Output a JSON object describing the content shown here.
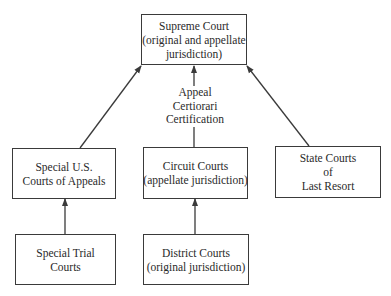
{
  "diagram": {
    "nodes": {
      "supreme": {
        "lines": [
          "Supreme Court",
          "(original and appellate",
          "jurisdiction)"
        ]
      },
      "special_appeals": {
        "lines": [
          "Special U.S.",
          "Courts of Appeals"
        ]
      },
      "circuit": {
        "lines": [
          "Circuit Courts",
          "(appellate jurisdiction)"
        ]
      },
      "state": {
        "lines": [
          "State Courts",
          "of",
          "Last Resort"
        ]
      },
      "special_trial": {
        "lines": [
          "Special Trial",
          "Courts"
        ]
      },
      "district": {
        "lines": [
          "District Courts",
          "(original jurisdiction)"
        ]
      }
    },
    "edge_label": {
      "lines": [
        "Appeal",
        "Certiorari",
        "Certification"
      ]
    },
    "edges": [
      {
        "from": "special_trial",
        "to": "special_appeals"
      },
      {
        "from": "district",
        "to": "circuit"
      },
      {
        "from": "special_appeals",
        "to": "supreme"
      },
      {
        "from": "circuit",
        "to": "supreme",
        "label": "Appeal / Certiorari / Certification"
      },
      {
        "from": "state",
        "to": "supreme"
      }
    ],
    "colors": {
      "line": "#3a3a3a",
      "text": "#2a2a2a",
      "background": "#ffffff"
    }
  }
}
